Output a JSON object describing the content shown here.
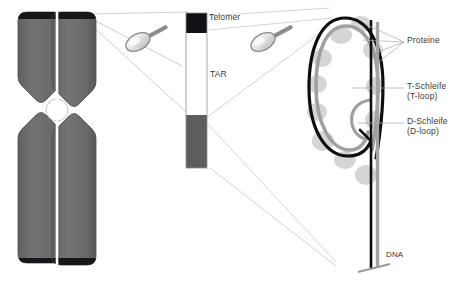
{
  "figure": {
    "type": "biology-diagram",
    "language": "de"
  },
  "colors": {
    "chromatid_fill": "#6c6c6c",
    "chromatid_edge": "#4a4a4a",
    "telomere_cap": "#15151a",
    "centromere": "#ffffff",
    "bar_telomere": "#111115",
    "bar_tar": "#ffffff",
    "bar_sub": "#5d5d5d",
    "bar_stroke": "#8a8a8a",
    "dna_outer_strand": "#101014",
    "dna_inner_strand": "#9a9a9a",
    "protein_blob": "#b9b9b9",
    "leader_line": "#b4b4b4",
    "label_text": "#3a3a3a",
    "magnifier_glass": "#e8e8e8",
    "magnifier_rim": "#8e8e8e",
    "magnifier_handle": "#7b7b7b"
  },
  "chromosome": {
    "name": "metaphase-chromosome",
    "chromatids": 2,
    "has_centromere": true,
    "telomere_caps": 4
  },
  "magnifiers": [
    {
      "name": "magnifier-1",
      "x": 138,
      "y": 42
    },
    {
      "name": "magnifier-2",
      "x": 263,
      "y": 42
    }
  ],
  "bar": {
    "name": "chromosome-end-bar",
    "segments": [
      {
        "key": "telomere",
        "label": "Telomer",
        "color": "#111115"
      },
      {
        "key": "tar",
        "label": "TAR",
        "color": "#ffffff"
      },
      {
        "key": "subtelomeric",
        "label": "",
        "color": "#5d5d5d"
      }
    ]
  },
  "labels": {
    "telomer": "Telomer",
    "tar": "TAR",
    "proteine": "Proteine",
    "t_schleife": "T-Schleife",
    "t_loop": "(T-loop)",
    "d_schleife": "D-Schleife",
    "d_loop": "(D-loop)",
    "dna": "DNA"
  },
  "tloop": {
    "name": "t-loop-structure",
    "protein_count": 11,
    "has_d_loop": true,
    "strands": 2
  }
}
